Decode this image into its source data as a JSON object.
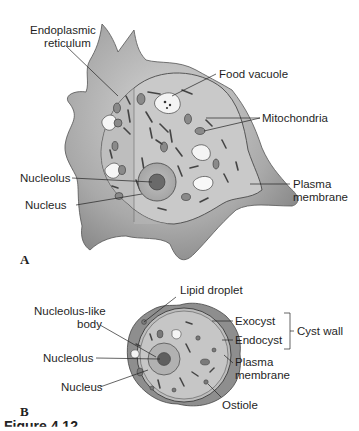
{
  "figure": {
    "panels": [
      {
        "id": "A",
        "label": "A",
        "title": "Amoeba trophozoite (cut-away view)",
        "labels": {
          "endoplasmic_reticulum_1": "Endoplasmic",
          "endoplasmic_reticulum_2": "reticulum",
          "food_vacuole": "Food vacuole",
          "mitochondria": "Mitochondria",
          "nucleolus": "Nucleolus",
          "nucleus": "Nucleus",
          "plasma_membrane_1": "Plasma",
          "plasma_membrane_2": "membrane"
        }
      },
      {
        "id": "B",
        "label": "B",
        "title": "Cyst",
        "labels": {
          "lipid_droplet": "Lipid droplet",
          "nucleolus_like_body_1": "Nucleolus-like",
          "nucleolus_like_body_2": "body",
          "nucleolus": "Nucleolus",
          "nucleus": "Nucleus",
          "exocyst": "Exocyst",
          "endocyst": "Endocyst",
          "cyst_wall": "Cyst wall",
          "plasma_membrane_1": "Plasma",
          "plasma_membrane_2": "membrane",
          "ostiole": "Ostiole"
        }
      }
    ],
    "caption": "Figure 4.12"
  },
  "colors": {
    "cell_outer": "#9a9a9a",
    "cell_inner": "#c8c8c8",
    "organelle": "#555555",
    "leader_line": "#222222"
  }
}
